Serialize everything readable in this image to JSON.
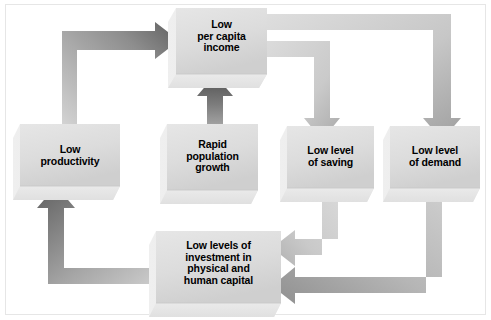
{
  "diagram": {
    "background_color": "#ffffff",
    "frame_color": "#e6e6e6",
    "box_fill_light": "#e3e3e3",
    "box_fill_mid": "#d0d0d0",
    "box_shadow": "#ededed",
    "arrow_dark": "#6b6b6b",
    "arrow_light": "#d2d2d2",
    "text_color": "#000000",
    "nodes": [
      {
        "id": "low-per-capita-income",
        "label": "Low\nper capita\nincome",
        "lines": [
          "Low",
          "per capita",
          "income"
        ],
        "x": 176,
        "y": 8,
        "w": 91,
        "h": 66
      },
      {
        "id": "low-productivity",
        "label": "Low\nproductivity",
        "lines": [
          "Low",
          "productivity"
        ],
        "x": 20,
        "y": 124,
        "w": 100,
        "h": 62
      },
      {
        "id": "rapid-population-growth",
        "label": "Rapid\npopulation\ngrowth",
        "lines": [
          "Rapid",
          "population",
          "growth"
        ],
        "x": 167,
        "y": 124,
        "w": 91,
        "h": 66
      },
      {
        "id": "low-level-of-saving",
        "label": "Low level\nof saving",
        "lines": [
          "Low level",
          "of saving"
        ],
        "x": 287,
        "y": 126,
        "w": 87,
        "h": 62
      },
      {
        "id": "low-level-of-demand",
        "label": "Low level\nof demand",
        "lines": [
          "Low level",
          "of demand"
        ],
        "x": 390,
        "y": 126,
        "w": 90,
        "h": 62
      },
      {
        "id": "low-levels-of-investment",
        "label": "Low levels of\ninvestment in\nphysical and\nhuman capital",
        "lines": [
          "Low levels of",
          "investment in",
          "physical and",
          "human capital"
        ],
        "x": 156,
        "y": 231,
        "w": 125,
        "h": 72
      }
    ],
    "arrows": [
      {
        "id": "productivity-to-income",
        "from": "low-productivity",
        "to": "low-per-capita-income",
        "shape": "up-then-right",
        "tone": "dark-head"
      },
      {
        "id": "income-to-demand",
        "from": "low-per-capita-income",
        "to": "low-level-of-demand",
        "shape": "right-then-down",
        "tone": "light"
      },
      {
        "id": "income-to-saving",
        "from": "low-per-capita-income",
        "to": "low-level-of-saving",
        "shape": "right-then-down",
        "tone": "light"
      },
      {
        "id": "population-to-income",
        "from": "rapid-population-growth",
        "to": "low-per-capita-income",
        "shape": "up",
        "tone": "dark"
      },
      {
        "id": "saving-to-investment",
        "from": "low-level-of-saving",
        "to": "low-levels-of-investment",
        "shape": "down-then-left",
        "tone": "light"
      },
      {
        "id": "demand-to-investment",
        "from": "low-level-of-demand",
        "to": "low-levels-of-investment",
        "shape": "down-then-left",
        "tone": "mid"
      },
      {
        "id": "investment-to-productivity",
        "from": "low-levels-of-investment",
        "to": "low-productivity",
        "shape": "left-then-up",
        "tone": "dark-head"
      }
    ]
  }
}
